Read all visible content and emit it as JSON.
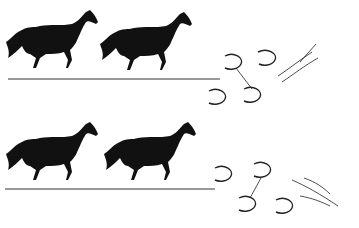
{
  "illustration": {
    "subject": "galloping horses with hoof-print sequence diagrams",
    "colors": {
      "ink": "#111111",
      "background": "#ffffff",
      "ground": "#333333"
    },
    "rows": [
      {
        "horses": 2,
        "hoofprints": [
          {
            "label": "lh",
            "x": 217,
            "y": 96
          },
          {
            "label": "rf",
            "x": 232,
            "y": 63
          },
          {
            "label": "rh",
            "x": 252,
            "y": 96
          },
          {
            "label": "lf",
            "x": 266,
            "y": 59
          }
        ],
        "motion_lines": true
      },
      {
        "horses": 2,
        "hoofprints": [
          {
            "label": "lh",
            "x": 222,
            "y": 173
          },
          {
            "label": "rh",
            "x": 262,
            "y": 170
          },
          {
            "label": "rf",
            "x": 246,
            "y": 203
          },
          {
            "label": "lf",
            "x": 283,
            "y": 205
          }
        ],
        "motion_lines": true
      }
    ]
  }
}
